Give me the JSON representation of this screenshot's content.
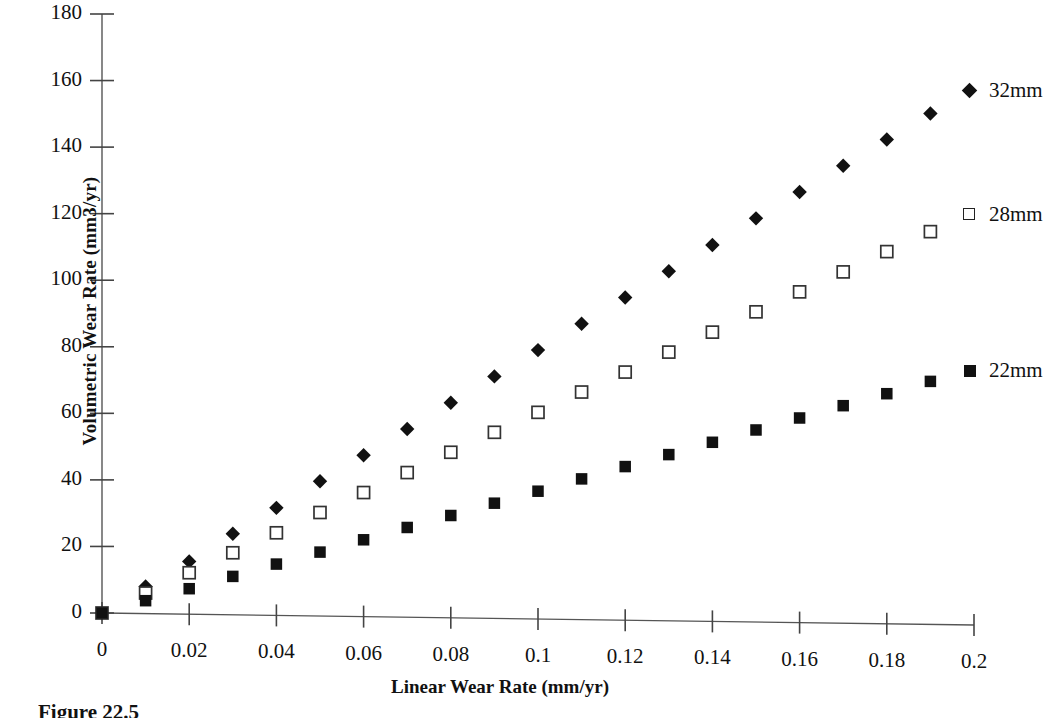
{
  "chart_data": {
    "type": "scatter",
    "title": "",
    "xlabel": "Linear Wear Rate (mm/yr)",
    "ylabel": "Volumetric Wear Rate (mm3/yr)",
    "xlim": [
      0,
      0.2
    ],
    "ylim": [
      0,
      180
    ],
    "xticks": [
      0,
      0.02,
      0.04,
      0.06,
      0.08,
      0.1,
      0.12,
      0.14,
      0.16,
      0.18,
      0.2
    ],
    "xtick_labels": [
      "0",
      "0.02",
      "0.04",
      "0.06",
      "0.08",
      "0.1",
      "0.12",
      "0.14",
      "0.16",
      "0.18",
      "0.2"
    ],
    "yticks": [
      0,
      20,
      40,
      60,
      80,
      100,
      120,
      140,
      160,
      180
    ],
    "ytick_labels": [
      "0",
      "20",
      "40",
      "60",
      "80",
      "100",
      "120",
      "140",
      "160",
      "180"
    ],
    "grid": false,
    "legend_position": "right",
    "x": [
      0,
      0.01,
      0.02,
      0.03,
      0.04,
      0.05,
      0.06,
      0.07,
      0.08,
      0.09,
      0.1,
      0.11,
      0.12,
      0.13,
      0.14,
      0.15,
      0.16,
      0.17,
      0.18,
      0.19
    ],
    "series": [
      {
        "name": "32mm",
        "marker": "filled-diamond",
        "color": "#111111",
        "values": [
          0,
          8,
          15.5,
          23.8,
          31.6,
          39.6,
          47.4,
          55.3,
          63.2,
          71.1,
          79,
          86.9,
          94.8,
          102.7,
          110.6,
          118.6,
          126.5,
          134.4,
          142.3,
          150.1
        ]
      },
      {
        "name": "28mm",
        "marker": "open-square",
        "color": "#111111",
        "values": [
          0,
          6,
          12.1,
          18.1,
          24.1,
          30.2,
          36.2,
          42.2,
          48.3,
          54.3,
          60.3,
          66.4,
          72.4,
          78.4,
          84.4,
          90.5,
          96.5,
          102.5,
          108.6,
          114.6
        ]
      },
      {
        "name": "22mm",
        "marker": "filled-square",
        "color": "#111111",
        "values": [
          0,
          3.7,
          7.3,
          11,
          14.7,
          18.3,
          22,
          25.7,
          29.3,
          33,
          36.6,
          40.3,
          44,
          47.6,
          51.3,
          55,
          58.6,
          62.3,
          65.9,
          69.6
        ]
      }
    ],
    "legend": [
      {
        "label": "32mm",
        "marker": "filled-diamond"
      },
      {
        "label": "28mm",
        "marker": "open-square"
      },
      {
        "label": "22mm",
        "marker": "filled-square"
      }
    ]
  },
  "caption": {
    "text": "Figure 22.5"
  }
}
